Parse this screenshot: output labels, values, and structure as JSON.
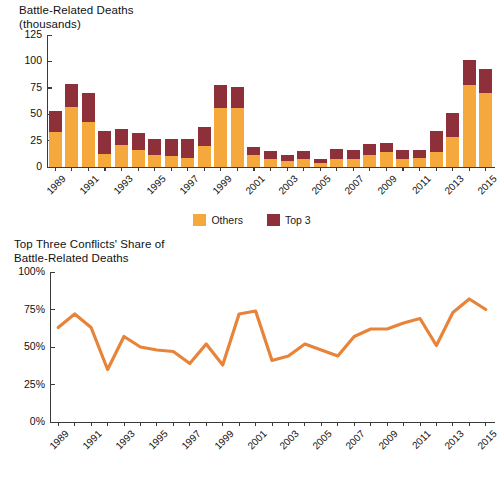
{
  "chart_data": [
    {
      "type": "bar",
      "id": "battle-related-deaths",
      "title": "Battle-Related Deaths\n(thousands)",
      "xlabel": "",
      "ylabel": "Battle-Related Deaths (thousands)",
      "ylim": [
        0,
        125
      ],
      "ytick_labels": [
        "125",
        "100",
        "75",
        "50",
        "25",
        "0"
      ],
      "yticks": [
        125,
        100,
        75,
        50,
        25,
        0
      ],
      "grid": false,
      "stacked": true,
      "legend_position": "bottom-center",
      "x": [
        1989,
        1990,
        1991,
        1992,
        1993,
        1994,
        1995,
        1996,
        1997,
        1998,
        1999,
        2000,
        2001,
        2002,
        2003,
        2004,
        2005,
        2006,
        2007,
        2008,
        2009,
        2010,
        2011,
        2012,
        2013,
        2014,
        2015
      ],
      "xtick_labels": [
        "1989",
        "1991",
        "1993",
        "1995",
        "1997",
        "1999",
        "2001",
        "2003",
        "2005",
        "2007",
        "2009",
        "2011",
        "2013",
        "2015"
      ],
      "series": [
        {
          "name": "Others",
          "color": "#f5a93c",
          "values": [
            33.5,
            57,
            43,
            12.5,
            21,
            16.5,
            11.5,
            10.5,
            9,
            20,
            55.5,
            55.5,
            11.5,
            7.5,
            5.5,
            8,
            3.5,
            7.5,
            7.5,
            11.5,
            14,
            8,
            8.5,
            14.5,
            28.5,
            78,
            70.5
          ]
        },
        {
          "name": "Top 3",
          "color": "#8d3039",
          "values": [
            20,
            22,
            27,
            22,
            15,
            15.5,
            15.5,
            16.5,
            17.5,
            17.5,
            22,
            20.5,
            7,
            8,
            6,
            7,
            4.5,
            9.5,
            9,
            10.5,
            8.5,
            8.5,
            8,
            20,
            23,
            23,
            22.5
          ]
        }
      ],
      "totals": [
        53.5,
        79,
        70,
        34.5,
        36,
        32,
        27,
        27,
        26.5,
        37.5,
        77.5,
        76,
        18.5,
        15.5,
        11.5,
        15,
        8,
        17,
        16.5,
        22,
        22.5,
        16.5,
        16.5,
        34.5,
        51.5,
        101,
        93
      ]
    },
    {
      "type": "line",
      "id": "top-three-share",
      "title": "Top Three Conflicts' Share of\nBattle-Related Deaths",
      "xlabel": "",
      "ylabel": "",
      "ylim": [
        0,
        100
      ],
      "ytick_labels": [
        "100%",
        "75%",
        "50%",
        "25%",
        "0%"
      ],
      "yticks": [
        100,
        75,
        50,
        25,
        0
      ],
      "grid": false,
      "color": "#e8833a",
      "x": [
        1989,
        1990,
        1991,
        1992,
        1993,
        1994,
        1995,
        1996,
        1997,
        1998,
        1999,
        2000,
        2001,
        2002,
        2003,
        2004,
        2005,
        2006,
        2007,
        2008,
        2009,
        2010,
        2011,
        2012,
        2013,
        2014,
        2015
      ],
      "xtick_labels": [
        "1989",
        "1991",
        "1993",
        "1995",
        "1997",
        "1999",
        "2001",
        "2003",
        "2005",
        "2007",
        "2009",
        "2011",
        "2013",
        "2015"
      ],
      "values": [
        63,
        72,
        63,
        35,
        57,
        50,
        48,
        47,
        39,
        52,
        38,
        72,
        74,
        41,
        44,
        52,
        48,
        44,
        57,
        62,
        62,
        66,
        69,
        51,
        73,
        82,
        75
      ]
    }
  ],
  "bar_chart": {
    "title": "Battle-Related Deaths\n(thousands)"
  },
  "line_chart": {
    "title": "Top Three Conflicts' Share of\nBattle-Related Deaths"
  },
  "legend": {
    "items": [
      {
        "label": "Others",
        "color": "#f5a93c"
      },
      {
        "label": "Top 3",
        "color": "#8d3039"
      }
    ]
  },
  "colors": {
    "others": "#f5a93c",
    "top3": "#8d3039",
    "line": "#e8833a",
    "axis": "#3a3a3a",
    "text": "#111111",
    "background": "#ffffff"
  }
}
